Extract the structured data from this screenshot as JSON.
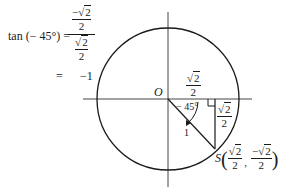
{
  "equation": {
    "lhs": "tan (− 45°) =",
    "big_fraction": {
      "numerator": {
        "sign": "−",
        "radical": "√",
        "radicand": "2",
        "denominator": "2"
      },
      "denominator": {
        "radical": "√",
        "radicand": "2",
        "denominator": "2"
      }
    },
    "equals": "=",
    "result": "−1"
  },
  "diagram": {
    "origin_label": "O",
    "angle_label": "− 45°",
    "radius_label": "1",
    "horizontal_leg": {
      "radical": "√",
      "radicand": "2",
      "denominator": "2"
    },
    "vertical_leg": {
      "radical": "√",
      "radicand": "2",
      "denominator": "2"
    },
    "point": {
      "name": "S",
      "x": {
        "radical": "√",
        "radicand": "2",
        "denominator": "2"
      },
      "y": {
        "sign": "−",
        "radical": "√",
        "radicand": "2",
        "denominator": "2"
      },
      "open": "(",
      "comma": ",",
      "close": ")"
    },
    "stroke_color": "#1a1a1a"
  }
}
